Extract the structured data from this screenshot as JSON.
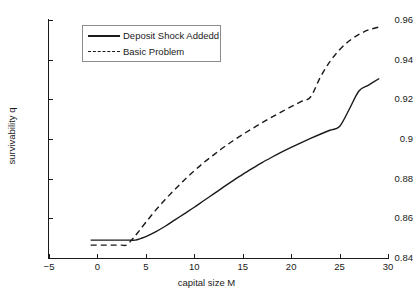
{
  "chart_data": {
    "type": "line",
    "title": "",
    "xlabel": "capital size M",
    "ylabel": "survivability q",
    "xlim": [
      -5,
      30
    ],
    "ylim": [
      0.84,
      0.96
    ],
    "xticks": [
      -5,
      0,
      5,
      10,
      15,
      20,
      25,
      30
    ],
    "xtick_labels": [
      "-5",
      "0",
      "5",
      "10",
      "15",
      "20",
      "25",
      "30"
    ],
    "yticks": [
      0.84,
      0.86,
      0.88,
      0.9,
      0.92,
      0.94,
      0.96
    ],
    "ytick_labels": [
      "0.84",
      "0.86",
      "0.88",
      "0.9",
      "0.92",
      "0.94",
      "0.96"
    ],
    "grid": false,
    "legend_position": "upper left",
    "series": [
      {
        "name": "Deposit Shock Addedd",
        "style": "solid",
        "color": "#1a1a1a",
        "x": [
          -0.7,
          0.5,
          1.5,
          2.5,
          3.3,
          3.9,
          4.5,
          5.0,
          6.0,
          7.0,
          8.0,
          9.0,
          10.0,
          11.0,
          12.0,
          13.0,
          14.0,
          15.0,
          16.0,
          17.0,
          18.0,
          19.0,
          20.0,
          21.0,
          22.0,
          23.0,
          24.0,
          25.0,
          26.0,
          27.0,
          28.0,
          29.1
        ],
        "y": [
          0.849,
          0.849,
          0.849,
          0.849,
          0.849,
          0.849,
          0.8499,
          0.8508,
          0.8532,
          0.856,
          0.8592,
          0.8624,
          0.8656,
          0.869,
          0.8723,
          0.8757,
          0.879,
          0.8822,
          0.8852,
          0.8881,
          0.8908,
          0.8934,
          0.8958,
          0.8981,
          0.9003,
          0.9024,
          0.9044,
          0.9063,
          0.915,
          0.9242,
          0.9272,
          0.9305
        ]
      },
      {
        "name": "Basic Problem",
        "style": "dashed",
        "color": "#1a1a1a",
        "x": [
          -0.7,
          0.5,
          1.5,
          2.5,
          3.0,
          3.6,
          4.2,
          5.0,
          6.0,
          7.0,
          8.0,
          9.0,
          10.0,
          11.0,
          12.0,
          13.0,
          14.0,
          15.0,
          16.0,
          17.0,
          18.0,
          19.0,
          20.0,
          21.0,
          22.0,
          23.0,
          24.0,
          25.0,
          26.0,
          27.0,
          28.0,
          29.1
        ],
        "y": [
          0.8465,
          0.8465,
          0.8465,
          0.8465,
          0.8465,
          0.8495,
          0.853,
          0.858,
          0.864,
          0.8695,
          0.8746,
          0.8795,
          0.884,
          0.8882,
          0.892,
          0.8957,
          0.8991,
          0.9023,
          0.9053,
          0.9082,
          0.911,
          0.9137,
          0.9163,
          0.9188,
          0.9212,
          0.931,
          0.939,
          0.945,
          0.9495,
          0.9527,
          0.955,
          0.9565
        ]
      }
    ]
  },
  "legend": {
    "items": [
      {
        "label": "Deposit Shock Addedd",
        "style": "solid"
      },
      {
        "label": "Basic Problem",
        "style": "dashed"
      }
    ]
  }
}
